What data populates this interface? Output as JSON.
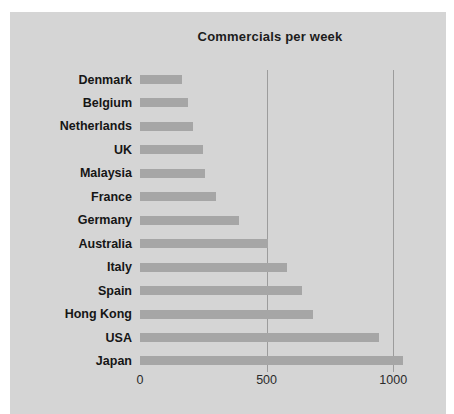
{
  "chart_data": {
    "type": "bar",
    "orientation": "horizontal",
    "title": "Commercials per week",
    "categories": [
      "Denmark",
      "Belgium",
      "Netherlands",
      "UK",
      "Malaysia",
      "France",
      "Germany",
      "Australia",
      "Italy",
      "Spain",
      "Hong Kong",
      "USA",
      "Japan"
    ],
    "values": [
      165,
      190,
      210,
      250,
      255,
      300,
      390,
      505,
      580,
      640,
      685,
      945,
      1040
    ],
    "xlabel": "",
    "ylabel": "",
    "x_ticks": [
      0,
      500,
      1000
    ],
    "xlim": [
      0,
      1100
    ],
    "gridlines_at": [
      500,
      1000
    ],
    "legend": "none",
    "bar_order": "shortest at top, longest (Japan) at bottom"
  },
  "colors": {
    "page_background": "#ffffff",
    "panel_background": "#d5d5d5",
    "bar_fill": "#a6a6a6",
    "gridline": "#9c9c9c",
    "text": "#1c1c1c"
  },
  "layout_notes": {
    "axis_lines": "none visible; only vertical gridlines at 500 and 1000"
  }
}
